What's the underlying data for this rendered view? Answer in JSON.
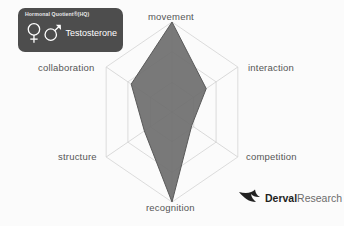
{
  "legend": {
    "title": "Hormonal Quotient®(HQ)",
    "hormone_label": "Testosterone",
    "female_icon": "female-symbol-icon",
    "male_icon": "male-symbol-icon",
    "badge_color": "#4d4d4d",
    "text_color": "#ffffff"
  },
  "brand": {
    "name_bold": "Derval",
    "name_light": "Research",
    "mark": "bird-swoosh-icon"
  },
  "chart_data": {
    "type": "radar",
    "title": "",
    "series_name": "Testosterone",
    "categories": [
      "movement",
      "interaction",
      "competition",
      "recognition",
      "structure",
      "collaboration"
    ],
    "values": [
      100,
      52,
      30,
      100,
      42,
      62
    ],
    "rmax": 100,
    "rings": [
      33,
      67,
      100
    ],
    "grid": true,
    "grid_shape": "hexagon",
    "legend_position": "top-left",
    "fill_color": "#6e6e6e",
    "fill_opacity": 0.92,
    "stroke_color": "#5a5a5a",
    "grid_color": "#d8d8d8",
    "axis_color": "#d0d0d0",
    "label_color": "#555555",
    "background_color": "#fbfbfb"
  }
}
